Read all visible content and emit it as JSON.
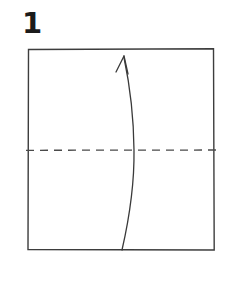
{
  "figure": {
    "kind": "origami-instruction-diagram",
    "step_number": "1",
    "background_color": "#ffffff",
    "ink_color": "#3a3a3a",
    "number_color": "#1b1b1b"
  },
  "paper": {
    "shape_name": "square-sheet",
    "stroke_color": "#3d3d3d",
    "stroke_width": 1.4,
    "left": 28,
    "top": 49,
    "right": 214,
    "bottom": 250,
    "width": 186,
    "height": 201
  },
  "fold_line": {
    "name": "horizontal-valley-fold-line",
    "style": "dashed",
    "stroke_color": "#4a4a4a",
    "stroke_width": 1.3,
    "dash_length": 8,
    "dash_gap": 6,
    "y": 150,
    "x_start": 26,
    "x_end": 216
  },
  "fold_arrow": {
    "name": "curved-fold-arrow",
    "direction": "bottom-to-top",
    "stroke_color": "#3a3a3a",
    "stroke_width": 1.3,
    "tail_x": 122,
    "tail_y": 250,
    "tip_x": 124,
    "tip_y": 56,
    "bulge_x": 134,
    "arrowhead_left_x": 116,
    "arrowhead_left_y": 72,
    "arrowhead_right_x": 128,
    "arrowhead_right_y": 74
  },
  "chart_data": {
    "type": "diagram",
    "elements": [
      {
        "label": "step-number",
        "value": "1"
      },
      {
        "label": "square-sheet",
        "value": "186 x 201 px outline"
      },
      {
        "label": "dashed-fold-line",
        "value": "horizontal at y=150"
      },
      {
        "label": "curved-arrow",
        "value": "from (122,250) to (124,56)"
      }
    ]
  }
}
